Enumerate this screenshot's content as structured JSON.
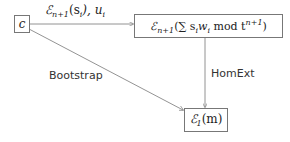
{
  "nodes": {
    "c": {
      "label": "c"
    },
    "enc_sum": {
      "label": "ℰn+1(∑ siwi mod tn+1)",
      "E": "ℰ",
      "sub": "n+1",
      "body": "(∑ s",
      "i1": "i",
      "w": "w",
      "i2": "i",
      "mod": " mod t",
      "sup": "n+1",
      "close": ")"
    },
    "enc_m": {
      "label": "ℰ1(m)",
      "E": "ℰ",
      "sub": "1",
      "body": "(m)"
    }
  },
  "edges": {
    "c_to_enc_sum": {
      "label": "ℰn+1(si), ui",
      "E": "ℰ",
      "sub": "n+1",
      "body": "(s",
      "i": "i",
      "rest": "), u",
      "i2": "i"
    },
    "c_to_enc_m": {
      "label": "Bootstrap"
    },
    "enc_sum_to_enc_m": {
      "label": "HomExt"
    }
  },
  "colors": {
    "line": "#777777",
    "text": "#222222"
  }
}
